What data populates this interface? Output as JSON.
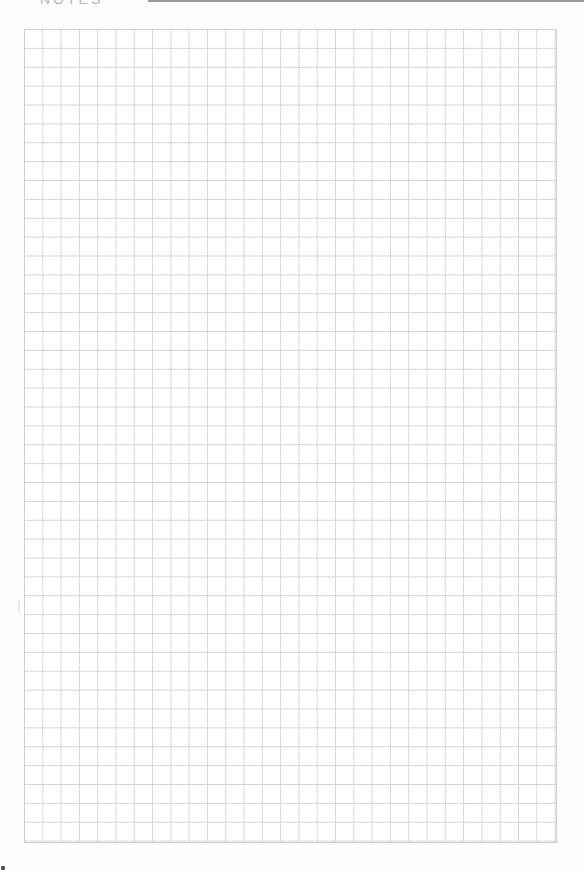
{
  "page": {
    "type": "graph-paper-sheet",
    "header": {
      "label": "NOTES",
      "rule_color": "#9a9a9a"
    },
    "grid": {
      "columns": 29,
      "rows": 43,
      "line_color": "#d6d6d6",
      "border_color": "#cfcfcf",
      "background_color": "#ffffff"
    }
  }
}
